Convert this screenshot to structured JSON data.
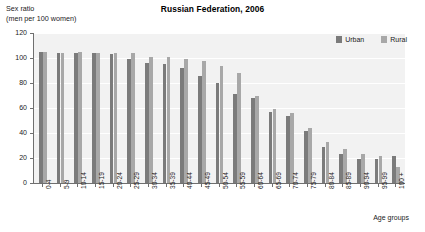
{
  "chart": {
    "title": "Russian Federation, 2006",
    "yaxis_caption": "Sex ratio\n(men per 100 women)",
    "xaxis_caption": "Age groups"
  },
  "legend": {
    "items": [
      {
        "label": "Urban",
        "color": "#7b7b7b",
        "swatch_name": "legend-swatch-urban"
      },
      {
        "label": "Rural",
        "color": "#a8a8a8",
        "swatch_name": "legend-swatch-rural"
      }
    ]
  },
  "chart_data": {
    "type": "bar",
    "title": "Russian Federation, 2006",
    "subtitle": "",
    "xlabel": "Age groups",
    "ylabel": "Sex ratio (men per 100 women)",
    "ylim": [
      0,
      120
    ],
    "yticks": [
      0,
      20,
      40,
      60,
      80,
      100,
      120
    ],
    "grid": true,
    "legend_position": "top-right",
    "categories": [
      "0-4",
      "5-9",
      "10-14",
      "15-19",
      "20-24",
      "25-29",
      "30-34",
      "35-39",
      "40-44",
      "45-49",
      "50-54",
      "55-59",
      "60-64",
      "65-69",
      "70-74",
      "75-79",
      "80-84",
      "85-89",
      "90-94",
      "95-99",
      "100 +"
    ],
    "series": [
      {
        "name": "Urban",
        "color": "#7b7b7b",
        "values": [
          105,
          104,
          104,
          104,
          103,
          99,
          96,
          95,
          92,
          86,
          80,
          71,
          68,
          57,
          54,
          42,
          29,
          23,
          19,
          19,
          22
        ]
      },
      {
        "name": "Rural",
        "color": "#a8a8a8",
        "values": [
          105,
          104,
          105,
          104,
          104,
          104,
          101,
          101,
          99,
          98,
          94,
          88,
          70,
          59,
          56,
          44,
          33,
          27,
          23,
          22,
          13
        ]
      }
    ]
  }
}
